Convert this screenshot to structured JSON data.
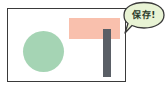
{
  "diagram": {
    "frame": {
      "border_color": "#3a3a3a",
      "background": "#ffffff"
    },
    "shapes": [
      {
        "kind": "circle",
        "color": "#a5d4b4"
      },
      {
        "kind": "rectangle",
        "color": "#f9c0ad"
      },
      {
        "kind": "bar",
        "color": "#5a5f66"
      }
    ],
    "speech_bubble": {
      "text": "保存!",
      "fill": "#e8f3d4",
      "stroke": "#3a3a3a"
    }
  }
}
